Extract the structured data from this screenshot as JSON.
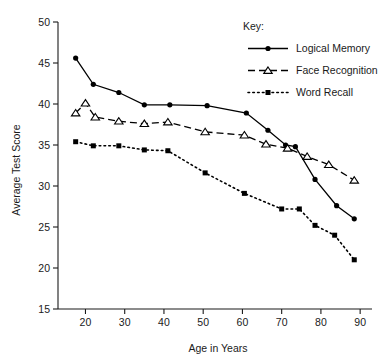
{
  "chart_data": {
    "type": "line",
    "title": "",
    "xlabel": "Age in Years",
    "ylabel": "Average Test Score",
    "xlim": [
      13,
      92
    ],
    "ylim": [
      15,
      50
    ],
    "xticks": [
      20,
      30,
      40,
      50,
      60,
      70,
      80,
      90
    ],
    "yticks": [
      15,
      20,
      25,
      30,
      35,
      40,
      45,
      50
    ],
    "grid": false,
    "legend_title": "Key:",
    "legend_position": "top-right",
    "series": [
      {
        "name": "Logical Memory",
        "marker": "filled-circle",
        "line_style": "solid",
        "color": "#000000",
        "points": [
          {
            "x": 17.5,
            "y": 45.6
          },
          {
            "x": 22.0,
            "y": 42.4
          },
          {
            "x": 28.5,
            "y": 41.4
          },
          {
            "x": 35.0,
            "y": 39.9
          },
          {
            "x": 41.5,
            "y": 39.9
          },
          {
            "x": 51.0,
            "y": 39.8
          },
          {
            "x": 61.0,
            "y": 38.9
          },
          {
            "x": 66.5,
            "y": 36.8
          },
          {
            "x": 71.0,
            "y": 35.0
          },
          {
            "x": 73.5,
            "y": 34.8
          },
          {
            "x": 78.5,
            "y": 30.8
          },
          {
            "x": 84.0,
            "y": 27.6
          },
          {
            "x": 88.5,
            "y": 26.0
          }
        ]
      },
      {
        "name": "Face Recognition",
        "marker": "open-triangle",
        "line_style": "dashed",
        "color": "#000000",
        "points": [
          {
            "x": 17.5,
            "y": 38.9
          },
          {
            "x": 20.0,
            "y": 40.1
          },
          {
            "x": 22.5,
            "y": 38.4
          },
          {
            "x": 28.5,
            "y": 37.9
          },
          {
            "x": 35.0,
            "y": 37.6
          },
          {
            "x": 41.0,
            "y": 37.8
          },
          {
            "x": 50.5,
            "y": 36.6
          },
          {
            "x": 60.5,
            "y": 36.2
          },
          {
            "x": 66.0,
            "y": 35.1
          },
          {
            "x": 71.5,
            "y": 34.6
          },
          {
            "x": 76.5,
            "y": 33.6
          },
          {
            "x": 82.0,
            "y": 32.6
          },
          {
            "x": 88.5,
            "y": 30.7
          }
        ]
      },
      {
        "name": "Word Recall",
        "marker": "filled-square",
        "line_style": "dotted",
        "color": "#000000",
        "points": [
          {
            "x": 17.5,
            "y": 35.4
          },
          {
            "x": 22.0,
            "y": 34.9
          },
          {
            "x": 28.5,
            "y": 34.9
          },
          {
            "x": 35.0,
            "y": 34.4
          },
          {
            "x": 41.0,
            "y": 34.3
          },
          {
            "x": 50.5,
            "y": 31.6
          },
          {
            "x": 60.5,
            "y": 29.1
          },
          {
            "x": 70.0,
            "y": 27.2
          },
          {
            "x": 74.5,
            "y": 27.2
          },
          {
            "x": 78.5,
            "y": 25.2
          },
          {
            "x": 83.5,
            "y": 24.0
          },
          {
            "x": 88.5,
            "y": 21.0
          }
        ]
      }
    ]
  }
}
